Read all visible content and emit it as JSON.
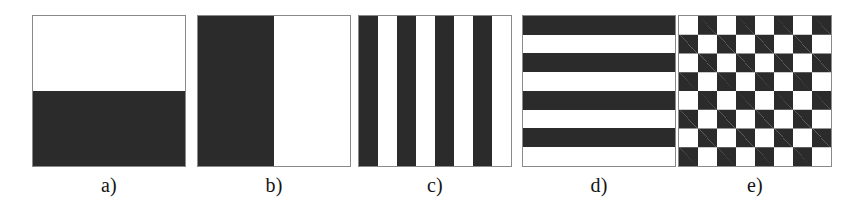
{
  "figure": {
    "width": 855,
    "height": 216,
    "background_color": "#ffffff",
    "dark_color": "#2b2b2b",
    "light_color": "#ffffff",
    "border_color": "#8a8a8a",
    "panel_count": 5
  },
  "panels": [
    {
      "id": "a",
      "caption": "a)",
      "pattern": "horizontal-half-split",
      "description": "Square split into white top half and dark bottom half",
      "bands": 2,
      "orientation": "horizontal",
      "first_band_color": "#ffffff",
      "left": 32
    },
    {
      "id": "b",
      "caption": "b)",
      "pattern": "vertical-half-split",
      "description": "Square split into dark left half and white right half",
      "bands": 2,
      "orientation": "vertical",
      "first_band_color": "#2b2b2b",
      "left": 197
    },
    {
      "id": "c",
      "caption": "c)",
      "pattern": "vertical-stripes",
      "description": "Square with eight alternating vertical stripes starting dark",
      "bands": 8,
      "orientation": "vertical",
      "first_band_color": "#2b2b2b",
      "left": 358
    },
    {
      "id": "d",
      "caption": "d)",
      "pattern": "horizontal-stripes",
      "description": "Square with eight alternating horizontal stripes starting dark",
      "bands": 8,
      "orientation": "horizontal",
      "first_band_color": "#2b2b2b",
      "left": 522
    },
    {
      "id": "e",
      "caption": "e)",
      "pattern": "checkerboard",
      "description": "Square with an eight by eight checkerboard starting dark at top left",
      "rows": 8,
      "columns": 8,
      "first_cell_color": "#2b2b2b",
      "left": 678
    }
  ]
}
